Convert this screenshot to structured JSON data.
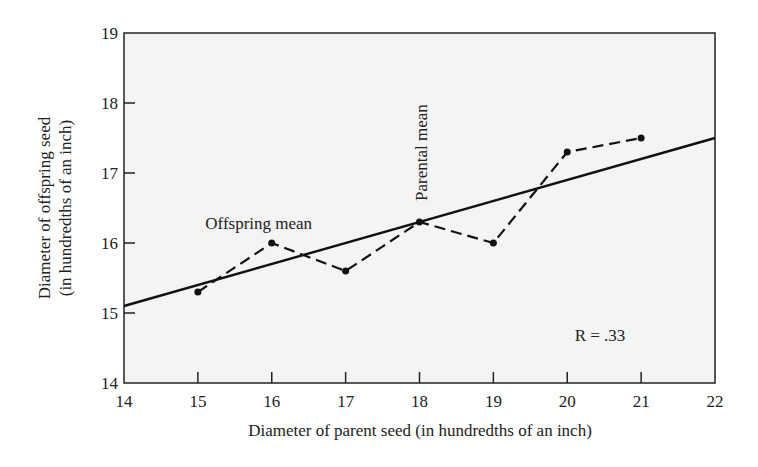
{
  "chart_data": {
    "type": "line",
    "title": "",
    "xlabel": "Diameter of parent seed (in hundredths of an inch)",
    "ylabel": "Diameter of offspring seed",
    "ylabel_line2": "(in hundredths of an inch)",
    "xlim": [
      14,
      22
    ],
    "ylim": [
      14,
      19
    ],
    "x_ticks": [
      14,
      15,
      16,
      17,
      18,
      19,
      20,
      21,
      22
    ],
    "y_ticks": [
      14,
      15,
      16,
      17,
      18,
      19
    ],
    "grid": false,
    "series": [
      {
        "name": "Observed offspring means",
        "style": "dashed-with-points",
        "x": [
          15,
          16,
          17,
          18,
          19,
          20,
          21
        ],
        "y": [
          15.3,
          16.0,
          15.6,
          16.3,
          16.0,
          17.3,
          17.5
        ]
      },
      {
        "name": "Regression line",
        "style": "solid",
        "x": [
          14,
          22
        ],
        "y": [
          15.1,
          17.5
        ]
      }
    ],
    "annotations": [
      {
        "text": "Offspring mean",
        "x": 15.1,
        "y": 16.2
      },
      {
        "text": "Parental mean",
        "x": 18.1,
        "y": 16.6,
        "rotation": "vertical"
      },
      {
        "text": "R = .33",
        "x": 20.1,
        "y": 14.6
      }
    ]
  }
}
